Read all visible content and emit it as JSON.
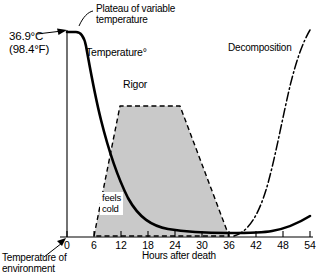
{
  "figure": {
    "background": "#ffffff",
    "ink": "#000000",
    "shade_color": "#c9c9c9"
  },
  "annotations": {
    "plateau": "Plateau of variable\ntemperature",
    "body_temperature": "36.9°C\n(98.4°F)",
    "temperature_curve": "Temperature°",
    "rigor": "Rigor",
    "decomposition": "Decomposition",
    "feels_cold": "feels\ncold",
    "environment_temperature": "Temperature of\nenvironment"
  },
  "axes": {
    "x_label": "Hours after death",
    "y_label": "Temperature°",
    "x_ticks": [
      "0",
      "6",
      "12",
      "18",
      "24",
      "30",
      "36",
      "42",
      "48",
      "54"
    ],
    "x_min": 0,
    "x_max": 54,
    "x_tick_step": 6,
    "y_ticks": [],
    "y_axis_visible": true
  },
  "chart_data": {
    "type": "line",
    "title": "",
    "subtitle": "",
    "xlabel": "Hours after death",
    "ylabel": "Temperature°",
    "xlim": [
      0,
      54
    ],
    "ylim": [
      0,
      1
    ],
    "grid": false,
    "legend": "none",
    "series": [
      {
        "name": "Temperature°",
        "style": "solid-thick",
        "note": "Body cooling curve: plateau of variable temperature at 36.9°C (98.4°F), steep fall, then asymptotic approach to environmental temperature, with slight late rise during decomposition",
        "x": [
          0,
          1,
          2,
          2.5,
          3,
          4,
          5,
          6,
          8,
          10,
          12,
          15,
          18,
          21,
          24,
          27,
          30,
          33,
          36,
          39,
          42,
          45,
          48,
          51,
          54
        ],
        "y": [
          1.0,
          1.0,
          0.99,
          0.95,
          0.88,
          0.74,
          0.63,
          0.55,
          0.44,
          0.36,
          0.29,
          0.21,
          0.15,
          0.11,
          0.085,
          0.07,
          0.06,
          0.05,
          0.045,
          0.042,
          0.04,
          0.048,
          0.062,
          0.082,
          0.105
        ]
      },
      {
        "name": "Decomposition",
        "style": "dash-dot",
        "note": "Onset of decomposition rising steeply from about 36-38 hours after death",
        "x": [
          37,
          39,
          42,
          45,
          48,
          51,
          54
        ],
        "y": [
          0.03,
          0.08,
          0.2,
          0.36,
          0.55,
          0.78,
          1.0
        ]
      }
    ],
    "shaded_regions": [
      {
        "name": "Rigor",
        "style": "dashed-outline-gray-fill",
        "fill": "#c9c9c9",
        "note": "Rigor mortis: onset about 6 hours, full/plateau 12-24 hours, passes off by about 36 hours",
        "vertices": [
          {
            "x": 6,
            "y": 0.0
          },
          {
            "x": 12,
            "y": 0.64
          },
          {
            "x": 24,
            "y": 0.64
          },
          {
            "x": 36,
            "y": 0.0
          }
        ]
      }
    ],
    "callouts": [
      {
        "text": "Plateau of variable temperature",
        "points_to": "top of temperature curve"
      },
      {
        "text": "36.9°C (98.4°F)",
        "points_to": "initial body temperature at time of death"
      },
      {
        "text": "feels cold",
        "points_to": "region where body feels cold to touch"
      },
      {
        "text": "Temperature of environment",
        "points_to": "origin / baseline of y-axis"
      }
    ]
  }
}
